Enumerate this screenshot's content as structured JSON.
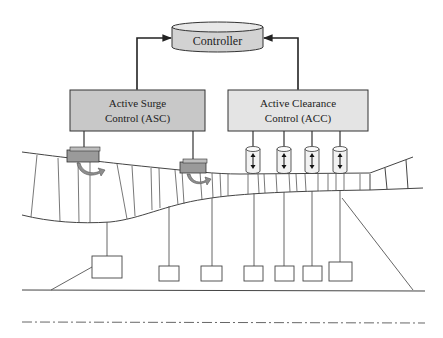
{
  "controller": {
    "label": "Controller",
    "fill": "#d4d4d4"
  },
  "asc": {
    "line1": "Active Surge",
    "line2": "Control (ASC)",
    "fill": "#c9c9c9"
  },
  "acc": {
    "line1": "Active Clearance",
    "line2": "Control (ACC)",
    "fill": "#e6e6e6"
  },
  "surge_actuators": [
    {
      "name": "surge-actuator-1"
    },
    {
      "name": "surge-actuator-2"
    }
  ],
  "clearance_actuators": [
    {
      "name": "clearance-actuator-1"
    },
    {
      "name": "clearance-actuator-2"
    },
    {
      "name": "clearance-actuator-3"
    },
    {
      "name": "clearance-actuator-4"
    }
  ],
  "sensor_boxes_count": 7,
  "colors": {
    "line": "#333333",
    "actuator_fill": "#9a9a9a",
    "arrow_fill": "#8e8e8e"
  }
}
